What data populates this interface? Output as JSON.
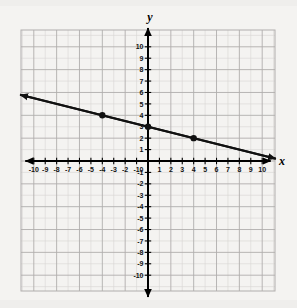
{
  "figure": {
    "title": "",
    "background_color": "#f4f3f1",
    "axis_color": "#000000",
    "grid_minor_color": "#d6d5d3",
    "grid_major_color": "#b0aead",
    "line_color": "#111111",
    "point_color": "#111111"
  },
  "labels": {
    "x_axis": "x",
    "y_axis": "y"
  },
  "chart_data": {
    "type": "line",
    "title": "",
    "xlabel": "x",
    "ylabel": "y",
    "xlim": [
      -10,
      10
    ],
    "ylim": [
      -10,
      10
    ],
    "grid": true,
    "legend": "none",
    "x_ticks": [
      -10,
      -9,
      -8,
      -7,
      -6,
      -5,
      -4,
      -3,
      -2,
      -1,
      0,
      1,
      2,
      3,
      4,
      5,
      6,
      7,
      8,
      9,
      10
    ],
    "y_ticks": [
      -10,
      -9,
      -8,
      -7,
      -6,
      -5,
      -4,
      -3,
      -2,
      -1,
      0,
      1,
      2,
      3,
      4,
      5,
      6,
      7,
      8,
      9,
      10
    ],
    "x_tick_labels": [
      "-10",
      "-9",
      "-8",
      "-7",
      "-6",
      "-5",
      "-4",
      "-3",
      "-2",
      "-1",
      "0",
      "1",
      "2",
      "3",
      "4",
      "5",
      "6",
      "7",
      "8",
      "9",
      "10"
    ],
    "y_tick_labels": [
      "-10",
      "-9",
      "-8",
      "-7",
      "-6",
      "-5",
      "-4",
      "-3",
      "-2",
      "-1",
      "0",
      "1",
      "2",
      "3",
      "4",
      "5",
      "6",
      "7",
      "8",
      "9",
      "10"
    ],
    "series": [
      {
        "name": "line",
        "equation": "y = -0.25x + 3",
        "slope": -0.25,
        "y_intercept": 3,
        "arrows": "both",
        "endpoints": [
          {
            "x": -11.2,
            "y": 5.8
          },
          {
            "x": 11.2,
            "y": 0.2
          }
        ],
        "marked_points": [
          {
            "x": -4,
            "y": 4
          },
          {
            "x": 0,
            "y": 3
          },
          {
            "x": 4,
            "y": 2
          }
        ]
      }
    ]
  }
}
